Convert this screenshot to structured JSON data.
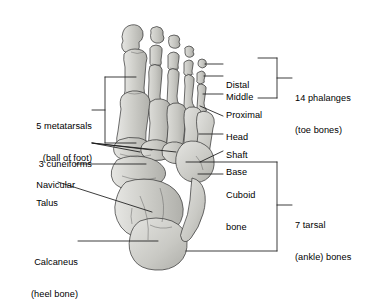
{
  "figure": {
    "colors": {
      "background": "#ffffff",
      "bone_fill": "#cfcfcc",
      "bone_fill_light": "#e2e2df",
      "bone_fill_dark": "#b4b4b0",
      "outline": "#2b2b2b",
      "leader": "#1a1a1a",
      "text": "#000000"
    }
  },
  "labels": {
    "metatarsals": {
      "line1": "5 metatarsals",
      "line2": "(ball of foot)"
    },
    "cuneiforms": {
      "line1": "3 cuneiforms"
    },
    "navicular": {
      "line1": "Navicular"
    },
    "talus": {
      "line1": "Talus"
    },
    "calcaneus": {
      "line1": "Calcaneus",
      "line2": "(heel bone)"
    },
    "distal": {
      "line1": "Distal"
    },
    "middle": {
      "line1": "Middle"
    },
    "proximal": {
      "line1": "Proximal"
    },
    "head": {
      "line1": "Head"
    },
    "shaft": {
      "line1": "Shaft"
    },
    "base": {
      "line1": "Base"
    },
    "cuboid": {
      "line1": "Cuboid",
      "line2": "bone"
    },
    "phalanges_group": {
      "line1": "14 phalanges",
      "line2": "(toe bones)"
    },
    "tarsal_group": {
      "line1": "7 tarsal",
      "line2": "(ankle) bones"
    }
  }
}
